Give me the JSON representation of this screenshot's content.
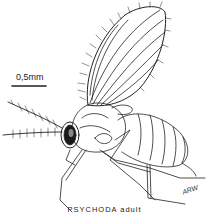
{
  "figure": {
    "caption": "PSYCHODA adult",
    "scale_bar": {
      "label": "0,5mm"
    },
    "signature": "ARW"
  },
  "colors": {
    "ink": "#222222",
    "background": "#ffffff"
  }
}
